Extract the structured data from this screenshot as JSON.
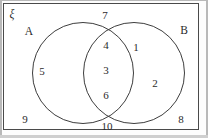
{
  "figure": {
    "type": "venn-diagram",
    "universe_symbol": "ξ",
    "set_labels": {
      "left": "A",
      "right": "B"
    },
    "colors": {
      "stroke": "#3d3d3d",
      "box_stroke": "#4a4a4a",
      "text": "#2b2b2b",
      "background": "#ffffff"
    },
    "regions": [
      {
        "id": "a-only",
        "region": "A only",
        "elements": [
          "5"
        ],
        "label": "5"
      },
      {
        "id": "intersection",
        "region": "A intersect B",
        "elements": [
          "4",
          "3",
          "6"
        ],
        "label_1": "4",
        "label_2": "3",
        "label_3": "6"
      },
      {
        "id": "b-only",
        "region": "B only",
        "elements": [
          "1",
          "2"
        ],
        "label_1": "1",
        "label_2": "2"
      },
      {
        "id": "outside",
        "region": "outside A and B",
        "elements": [
          "7",
          "9",
          "10",
          "8"
        ],
        "label_top": "7",
        "label_bottom_left": "9",
        "label_bottom_center": "10",
        "label_bottom_right": "8"
      }
    ]
  }
}
